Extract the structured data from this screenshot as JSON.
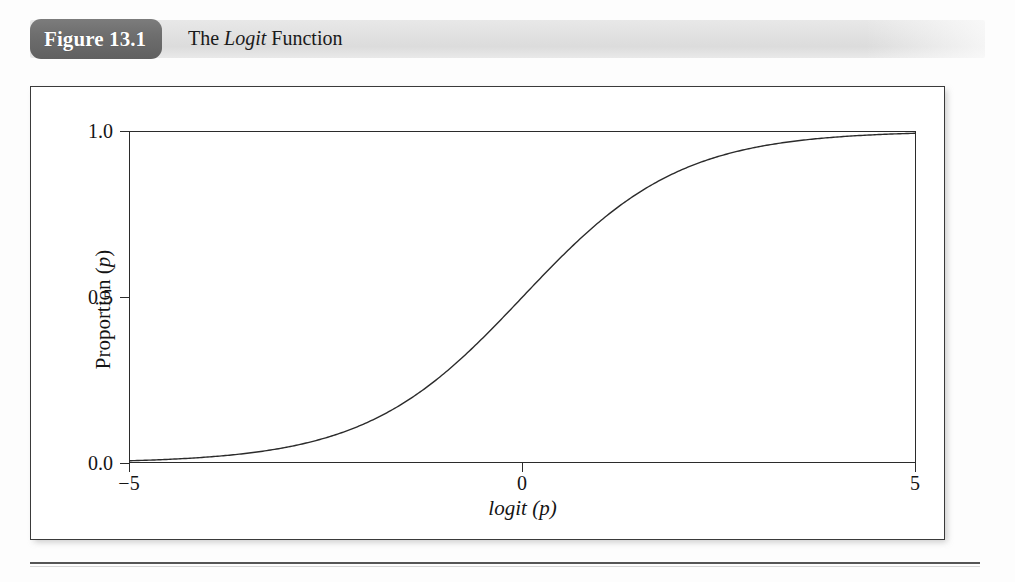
{
  "figure": {
    "badge_label": "Figure 13.1",
    "caption_prefix": "The ",
    "caption_italic": "Logit",
    "caption_suffix": " Function",
    "badge_color": "#6e6e6e",
    "band_color": "#e2e2e2",
    "ink_color": "#1a1a1a"
  },
  "chart_data": {
    "type": "line",
    "title": "The Logit Function",
    "xlabel": "logit (p)",
    "ylabel": "Proportion (p)",
    "xlabel_parts": {
      "italic_name": "logit",
      "italic_arg": "p"
    },
    "ylabel_parts": {
      "name": "Proportion",
      "italic_arg": "p"
    },
    "xlim": [
      -5,
      5
    ],
    "ylim": [
      0.0,
      1.0
    ],
    "xticks": [
      -5,
      0,
      5
    ],
    "xtick_labels": [
      "−5",
      "0",
      "5"
    ],
    "yticks": [
      0.0,
      0.5,
      1.0
    ],
    "ytick_labels": [
      "0.0",
      "0.5",
      "1.0"
    ],
    "grid": false,
    "legend": null,
    "series": [
      {
        "name": "logistic p = 1/(1+e^-logit(p))",
        "x": [
          -5.0,
          -4.5,
          -4.0,
          -3.5,
          -3.0,
          -2.5,
          -2.0,
          -1.5,
          -1.0,
          -0.5,
          0.0,
          0.5,
          1.0,
          1.5,
          2.0,
          2.5,
          3.0,
          3.5,
          4.0,
          4.5,
          5.0
        ],
        "y": [
          0.007,
          0.011,
          0.018,
          0.029,
          0.047,
          0.076,
          0.119,
          0.182,
          0.269,
          0.378,
          0.5,
          0.622,
          0.731,
          0.818,
          0.881,
          0.924,
          0.953,
          0.971,
          0.982,
          0.989,
          0.993
        ],
        "color": "#2b2b2b",
        "linewidth": 1.4
      }
    ]
  },
  "ticks": {
    "y": [
      {
        "label": "1.0",
        "value": 1.0
      },
      {
        "label": "0.5",
        "value": 0.5
      },
      {
        "label": "0.0",
        "value": 0.0
      }
    ],
    "x": [
      {
        "label": "−5",
        "value": -5
      },
      {
        "label": "0",
        "value": 0
      },
      {
        "label": "5",
        "value": 5
      }
    ]
  }
}
